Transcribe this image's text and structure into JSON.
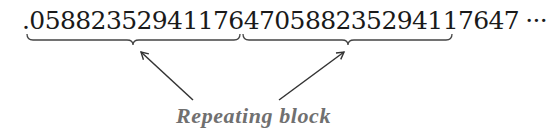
{
  "diagram": {
    "decimal_prefix": ".",
    "repeating_blocks": [
      "0588235294117647",
      "0588235294117647"
    ],
    "ellipsis": "···",
    "caption": "Repeating block",
    "colors": {
      "digits": "#1a1a1a",
      "brace": "#444444",
      "arrow": "#333333",
      "caption": "#707070"
    }
  }
}
